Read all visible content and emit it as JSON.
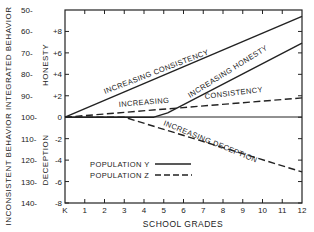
{
  "chart_data": {
    "type": "line",
    "title": "",
    "xlabel": "SCHOOL GRADES",
    "ylabel_outer": "INCONSISTENT BEHAVIOR   INTEGRATED BEHAVIOR",
    "ylabel_upper": "HONESTY",
    "ylabel_lower": "DECEPTION",
    "x_ticks": [
      "K",
      "1",
      "2",
      "3",
      "4",
      "5",
      "6",
      "7",
      "8",
      "9",
      "10",
      "11",
      "12"
    ],
    "y_ticks_inner": [
      "+8",
      "+6",
      "+4",
      "+2",
      "0",
      "-2",
      "-4",
      "-6",
      "-8"
    ],
    "y_ticks_outer": [
      "50-",
      "60-",
      "70-",
      "80-",
      "90-",
      "100-",
      "110-",
      "120-",
      "130-",
      "140-"
    ],
    "ylim": [
      -8,
      10
    ],
    "xlim": [
      0,
      12
    ],
    "grid": false,
    "legend": {
      "position": "lower-left inside",
      "entries": [
        {
          "label": "POPULATION Y",
          "style": "solid"
        },
        {
          "label": "POPULATION Z",
          "style": "dashed"
        }
      ]
    },
    "series": [
      {
        "name": "Population Y - Increasing Consistency",
        "style": "solid",
        "x": [
          0,
          12
        ],
        "y": [
          0,
          9.4
        ]
      },
      {
        "name": "Population Y - Increasing Honesty",
        "style": "solid",
        "x": [
          0,
          4.5,
          5.2,
          12
        ],
        "y": [
          0,
          0,
          0.4,
          6.9
        ]
      },
      {
        "name": "Population Z - Increasing Consistency",
        "style": "dashed",
        "x": [
          0,
          12
        ],
        "y": [
          0,
          1.8
        ]
      },
      {
        "name": "Population Z - Increasing Deception",
        "style": "dashed",
        "x": [
          0,
          3,
          12
        ],
        "y": [
          0,
          0,
          -5.1
        ]
      }
    ],
    "annotations": [
      "INCREASING CONSISTENCY",
      "INCREASING HONESTY",
      "INCREASING",
      "CONSISTENCY",
      "INCREASING DECEPTION"
    ]
  }
}
